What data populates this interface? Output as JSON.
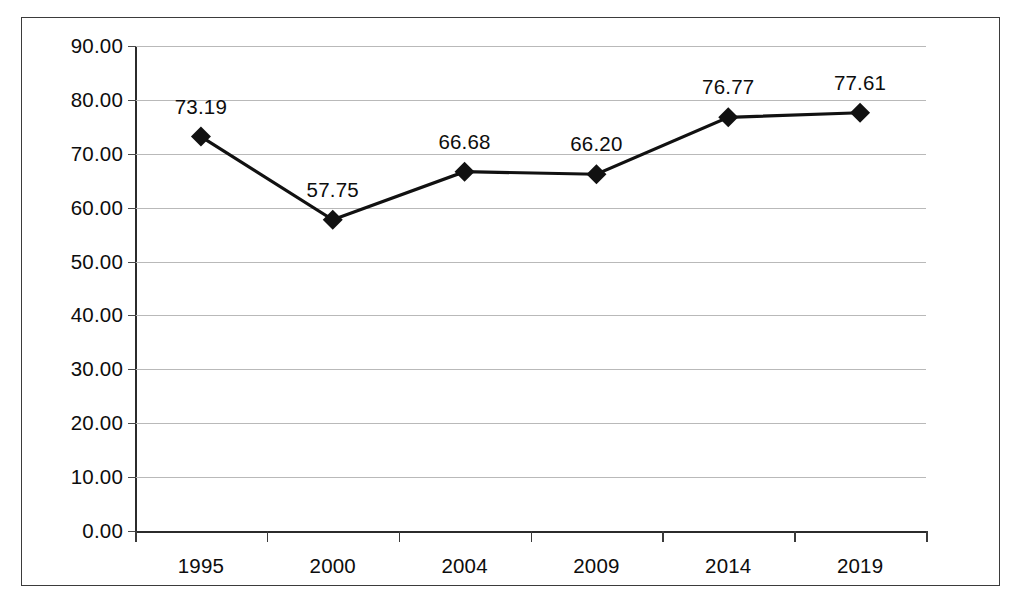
{
  "chart_data": {
    "type": "line",
    "title": "",
    "subtitle": "",
    "xlabel": "",
    "ylabel": "",
    "categories": [
      "1995",
      "2000",
      "2004",
      "2009",
      "2014",
      "2019"
    ],
    "values": [
      73.19,
      57.75,
      66.68,
      66.2,
      76.77,
      77.61
    ],
    "point_labels": [
      "73.19",
      "57.75",
      "66.68",
      "66.20",
      "76.77",
      "77.61"
    ],
    "series": [
      {
        "name": "",
        "values": [
          73.19,
          57.75,
          66.68,
          66.2,
          76.77,
          77.61
        ]
      }
    ],
    "ylim": [
      0,
      90
    ],
    "yticks": [
      0,
      10,
      20,
      30,
      40,
      50,
      60,
      70,
      80,
      90
    ],
    "ytick_labels": [
      "0.00",
      "10.00",
      "20.00",
      "30.00",
      "40.00",
      "50.00",
      "60.00",
      "70.00",
      "80.00",
      "90.00"
    ],
    "grid": true,
    "grid_axis": "y",
    "legend": false,
    "legend_position": "none",
    "marker": "diamond",
    "line_color": "#111111",
    "marker_color": "#111111",
    "grid_color": "#b9b9b9",
    "axis_color": "#2b2b2b",
    "border_color": "#3b3b3b",
    "background_color": "#ffffff"
  }
}
